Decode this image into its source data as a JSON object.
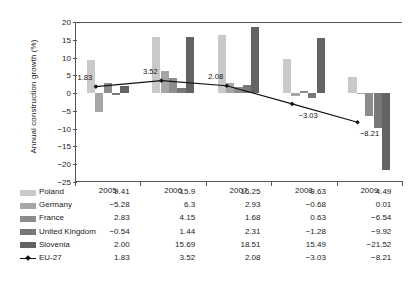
{
  "chart_data": {
    "type": "bar",
    "title": "",
    "xlabel": "",
    "ylabel": "Annual construction growth (%)",
    "categories": [
      "2005",
      "2006",
      "2007",
      "2008",
      "2009"
    ],
    "ylim": [
      -25,
      20
    ],
    "yticks": [
      20,
      15,
      10,
      5,
      0,
      -5,
      -10,
      -15,
      -20,
      -25
    ],
    "grid": false,
    "legend_position": "bottom-table",
    "series": [
      {
        "name": "Poland",
        "type": "bar",
        "color": "#c9c9c9",
        "values": [
          9.41,
          15.9,
          16.25,
          9.63,
          4.49
        ]
      },
      {
        "name": "Germany",
        "type": "bar",
        "color": "#a6a6a6",
        "values": [
          -5.28,
          6.3,
          2.93,
          -0.68,
          0.01
        ]
      },
      {
        "name": "France",
        "type": "bar",
        "color": "#8c8c8c",
        "values": [
          2.83,
          4.15,
          1.68,
          0.63,
          -6.54
        ]
      },
      {
        "name": "United Kingdom",
        "type": "bar",
        "color": "#787878",
        "values": [
          -0.54,
          1.44,
          2.31,
          -1.28,
          -9.92
        ]
      },
      {
        "name": "Slovenia",
        "type": "bar",
        "color": "#636363",
        "values": [
          2.0,
          15.69,
          18.51,
          15.49,
          -21.52
        ]
      },
      {
        "name": "EU-27",
        "type": "line",
        "color": "#111111",
        "values": [
          1.83,
          3.52,
          2.08,
          -3.03,
          -8.21
        ]
      }
    ],
    "annotations": [
      {
        "text": "1.83",
        "year": "2005",
        "value": 1.83
      },
      {
        "text": "3.52",
        "year": "2006",
        "value": 3.52
      },
      {
        "text": "2.08",
        "year": "2007",
        "value": 2.08
      },
      {
        "text": "−3.03",
        "year": "2008",
        "value": -3.03
      },
      {
        "text": "−8.21",
        "year": "2009",
        "value": -8.21
      }
    ]
  },
  "table": {
    "header": [
      "",
      "2005",
      "2006",
      "2007",
      "2008",
      "2009"
    ],
    "rows": [
      {
        "label": "Poland",
        "values": [
          "9.41",
          "15.9",
          "16.25",
          "9.63",
          "4.49"
        ]
      },
      {
        "label": "Germany",
        "values": [
          "−5.28",
          "6.3",
          "2.93",
          "−0.68",
          "0.01"
        ]
      },
      {
        "label": "France",
        "values": [
          "2.83",
          "4.15",
          "1.68",
          "0.63",
          "−6.54"
        ]
      },
      {
        "label": "United Kingdom",
        "values": [
          "−0.54",
          "1.44",
          "2.31",
          "−1.28",
          "−9.92"
        ]
      },
      {
        "label": "Slovenia",
        "values": [
          "2.00",
          "15.69",
          "18.51",
          "15.49",
          "−21.52"
        ]
      },
      {
        "label": "EU-27",
        "values": [
          "1.83",
          "3.52",
          "2.08",
          "−3.03",
          "−8.21"
        ]
      }
    ]
  }
}
